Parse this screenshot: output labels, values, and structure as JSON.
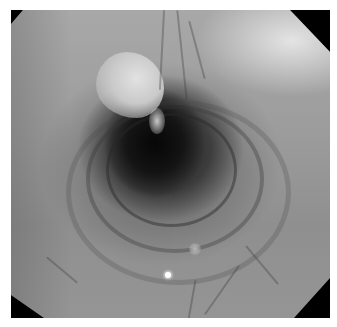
{
  "image": {
    "type": "endoscopic-view",
    "description": "Grayscale endoscopic view of a tubular lumen with concentric circular folds, a bright mucosal fold at upper-left of the opening, visible blood vessels, and a small specular reflection near the bottom",
    "frame_shape": "octagon",
    "palette": {
      "frame": "#000000",
      "mucosa": "#9c9c9c",
      "lumen": "#0a0a0a",
      "highlight": "#e2e2e2",
      "reflection": "#ffffff"
    }
  }
}
